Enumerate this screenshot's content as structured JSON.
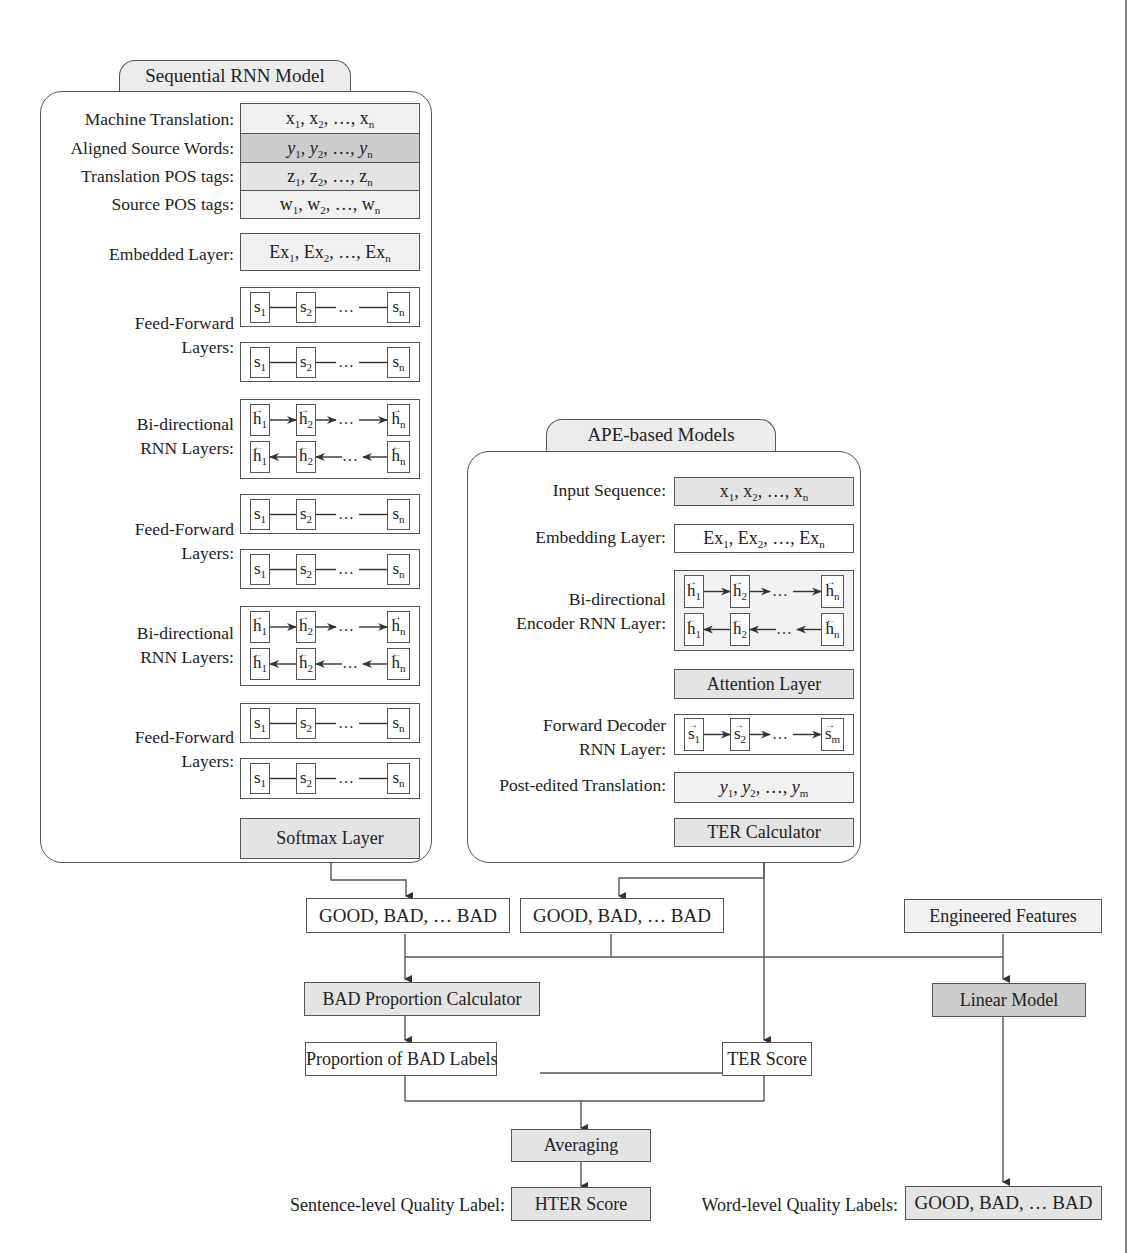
{
  "rnn_model": {
    "title": "Sequential RNN Model",
    "inputs": [
      {
        "label": "Machine Translation:",
        "value": "x",
        "shade": "light"
      },
      {
        "label": "Aligned Source Words:",
        "value": "y",
        "shade": "dark"
      },
      {
        "label": "Translation POS tags:",
        "value": "z",
        "shade": "medium"
      },
      {
        "label": "Source POS tags:",
        "value": "w",
        "shade": "lightest"
      }
    ],
    "embedded_label": "Embedded Layer:",
    "embedded_value": "Ex",
    "ff_label": "Feed-Forward Layers:",
    "ff_label_line1": "Feed-Forward",
    "ff_label_line2": "Layers:",
    "bi_label_line1": "Bi-directional",
    "bi_label_line2": "RNN Layers:",
    "state_symbol": "s",
    "hidden_symbol": "h",
    "idx1": "1",
    "idx2": "2",
    "idxn": "n",
    "ellipsis": "…",
    "softmax": "Softmax Layer"
  },
  "ape_model": {
    "title": "APE-based Models",
    "input_label": "Input Sequence:",
    "input_value": "x",
    "embedding_label": "Embedding Layer:",
    "embedding_value": "Ex",
    "encoder_label_line1": "Bi-directional",
    "encoder_label_line2": "Encoder RNN Layer:",
    "attention": "Attention Layer",
    "decoder_label_line1": "Forward Decoder",
    "decoder_label_line2": "RNN Layer:",
    "decoder_idxm": "m",
    "post_edited_label": "Post-edited Translation:",
    "post_edited_value": "y",
    "ter_calculator": "TER Calculator"
  },
  "pipeline": {
    "rnn_labels_output": "GOOD, BAD, … BAD",
    "ape_labels_output": "GOOD, BAD, … BAD",
    "engineered_features": "Engineered Features",
    "bad_proportion_calculator": "BAD Proportion Calculator",
    "linear_model": "Linear Model",
    "proportion_bad_labels": "Proportion of BAD Labels",
    "ter_score": "TER Score",
    "averaging": "Averaging",
    "sentence_level_label": "Sentence-level Quality Label:",
    "hter_score": "HTER Score",
    "word_level_label": "Word-level Quality Labels:",
    "word_level_output": "GOOD, BAD, … BAD"
  },
  "colors": {
    "line": "#555555",
    "box_light": "#f1f1f1",
    "box_medium": "#e4e4e4",
    "box_dark": "#cdcdcd",
    "box_darker": "#bdbdbd"
  }
}
